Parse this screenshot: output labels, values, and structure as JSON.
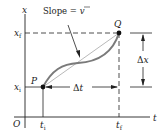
{
  "diagram": {
    "axes": {
      "vertical_label": "x",
      "horizontal_label": "t",
      "origin_label": "O"
    },
    "points": [
      {
        "label": "P",
        "t": "t_i",
        "x": "x_i"
      },
      {
        "label": "Q",
        "t": "t_f",
        "x": "x_f"
      }
    ],
    "tick_labels": {
      "x_f": {
        "main": "x",
        "sub": "f"
      },
      "x_i": {
        "main": "x",
        "sub": "i"
      },
      "t_i": {
        "main": "t",
        "sub": "i"
      },
      "t_f": {
        "main": "t",
        "sub": "f"
      }
    },
    "annotations": {
      "slope": {
        "text": "Slope = ",
        "symbol": "v",
        "bar": true
      },
      "delta_t": {
        "delta": "Δ",
        "var": "t"
      },
      "delta_x": {
        "delta": "Δ",
        "var": "x"
      }
    },
    "colors": {
      "curve": "#7a7a7a",
      "lines": "#222222",
      "points": "#111111",
      "chord": "#9a9a9a"
    }
  }
}
